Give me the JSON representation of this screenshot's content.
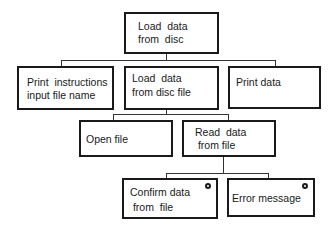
{
  "diagram": {
    "type": "hierarchy-chart",
    "root": {
      "label_line1": "Load  data",
      "label_line2": "from  disc"
    },
    "level2": [
      {
        "label_line1": "Print  instructions",
        "label_line2": "input file name"
      },
      {
        "label_line1": "Load  data",
        "label_line2": "from disc file"
      },
      {
        "label_line1": "Print data",
        "label_line2": ""
      }
    ],
    "level3": [
      {
        "label_line1": "Open file",
        "label_line2": ""
      },
      {
        "label_line1": "Read  data",
        "label_line2": " from file"
      }
    ],
    "level4": [
      {
        "label_line1": "Confirm data",
        "label_line2": " from  file",
        "marker": "circle"
      },
      {
        "label_line1": "Error message",
        "label_line2": "",
        "marker": "circle"
      }
    ],
    "line_color": "#333333",
    "border_color": "#1a1a1a"
  }
}
